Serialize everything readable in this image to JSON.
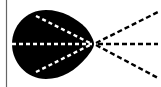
{
  "diagram": {
    "colors": {
      "background": "#ffffff",
      "shape": "#000000",
      "dash_on_shape": "#ffffff",
      "dash_outside": "#000000",
      "border": "#666666"
    },
    "apex": [
      94,
      44
    ],
    "rays_right": [
      {
        "name": "upper-ray",
        "to": [
          158,
          12
        ]
      },
      {
        "name": "middle-ray",
        "to": [
          158,
          44
        ]
      },
      {
        "name": "lower-ray",
        "to": [
          158,
          78
        ]
      }
    ],
    "rays_left": [
      {
        "name": "upper-inner-ray",
        "from": [
          36,
          16
        ]
      },
      {
        "name": "middle-inner-ray",
        "from": [
          12,
          44
        ]
      },
      {
        "name": "lower-inner-ray",
        "from": [
          36,
          72
        ]
      }
    ]
  }
}
